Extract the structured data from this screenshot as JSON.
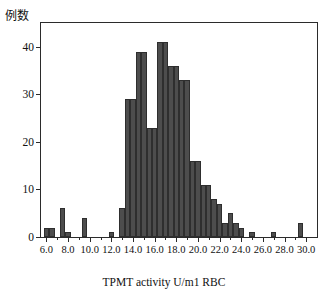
{
  "figure": {
    "y_axis_title": "例数",
    "x_axis_title": "TPMT activity U/m1 RBC",
    "bar_color": "#4d4d4d",
    "bar_edge_color": "#2e2e2e",
    "axis_color": "#2b2b2b",
    "background": "#ffffff"
  },
  "chart_data": {
    "type": "bar",
    "title": "",
    "subtitle": "",
    "xlabel": "TPMT activity U/m1 RBC",
    "ylabel": "例数",
    "xlim": [
      5.5,
      31.0
    ],
    "ylim": [
      0,
      45
    ],
    "grid": false,
    "legend": null,
    "bin_width": 0.5,
    "x_tick_labels": [
      "6.0",
      "8.0",
      "10.0",
      "12.0",
      "14.0",
      "16.0",
      "18.0",
      "20.0",
      "22.0",
      "24.0",
      "26.0",
      "28.0",
      "30.0"
    ],
    "x_tick_values": [
      6.0,
      8.0,
      10.0,
      12.0,
      14.0,
      16.0,
      18.0,
      20.0,
      22.0,
      24.0,
      26.0,
      28.0,
      30.0
    ],
    "y_tick_labels": [
      "0",
      "10",
      "20",
      "30",
      "40"
    ],
    "y_tick_values": [
      0,
      10,
      20,
      30,
      40
    ],
    "bins": [
      {
        "x0": 5.75,
        "x1": 6.25,
        "value": 2
      },
      {
        "x0": 6.25,
        "x1": 6.75,
        "value": 2
      },
      {
        "x0": 6.75,
        "x1": 7.25,
        "value": 0
      },
      {
        "x0": 7.25,
        "x1": 7.75,
        "value": 6
      },
      {
        "x0": 7.75,
        "x1": 8.25,
        "value": 1
      },
      {
        "x0": 8.25,
        "x1": 8.75,
        "value": 0
      },
      {
        "x0": 8.75,
        "x1": 9.25,
        "value": 0
      },
      {
        "x0": 9.25,
        "x1": 9.75,
        "value": 4
      },
      {
        "x0": 9.75,
        "x1": 10.25,
        "value": 0
      },
      {
        "x0": 10.25,
        "x1": 10.75,
        "value": 0
      },
      {
        "x0": 10.75,
        "x1": 11.25,
        "value": 0
      },
      {
        "x0": 11.25,
        "x1": 11.75,
        "value": 0
      },
      {
        "x0": 11.75,
        "x1": 12.25,
        "value": 1
      },
      {
        "x0": 12.25,
        "x1": 12.75,
        "value": 0
      },
      {
        "x0": 12.75,
        "x1": 13.25,
        "value": 6
      },
      {
        "x0": 13.25,
        "x1": 13.75,
        "value": 29
      },
      {
        "x0": 13.75,
        "x1": 14.25,
        "value": 29
      },
      {
        "x0": 14.25,
        "x1": 14.75,
        "value": 39
      },
      {
        "x0": 14.75,
        "x1": 15.25,
        "value": 39
      },
      {
        "x0": 15.25,
        "x1": 15.75,
        "value": 23
      },
      {
        "x0": 15.75,
        "x1": 16.25,
        "value": 23
      },
      {
        "x0": 16.25,
        "x1": 16.75,
        "value": 41
      },
      {
        "x0": 16.75,
        "x1": 17.25,
        "value": 41
      },
      {
        "x0": 17.25,
        "x1": 17.75,
        "value": 36
      },
      {
        "x0": 17.75,
        "x1": 18.25,
        "value": 36
      },
      {
        "x0": 18.25,
        "x1": 18.75,
        "value": 33
      },
      {
        "x0": 18.75,
        "x1": 19.25,
        "value": 33
      },
      {
        "x0": 19.25,
        "x1": 19.75,
        "value": 16
      },
      {
        "x0": 19.75,
        "x1": 20.25,
        "value": 16
      },
      {
        "x0": 20.25,
        "x1": 20.75,
        "value": 11
      },
      {
        "x0": 20.75,
        "x1": 21.25,
        "value": 11
      },
      {
        "x0": 21.25,
        "x1": 21.75,
        "value": 8
      },
      {
        "x0": 21.75,
        "x1": 22.25,
        "value": 7
      },
      {
        "x0": 22.25,
        "x1": 22.75,
        "value": 3
      },
      {
        "x0": 22.75,
        "x1": 23.25,
        "value": 5
      },
      {
        "x0": 23.25,
        "x1": 23.75,
        "value": 3
      },
      {
        "x0": 23.75,
        "x1": 24.25,
        "value": 2
      },
      {
        "x0": 24.25,
        "x1": 24.75,
        "value": 0
      },
      {
        "x0": 24.75,
        "x1": 25.25,
        "value": 1
      },
      {
        "x0": 25.25,
        "x1": 25.75,
        "value": 0
      },
      {
        "x0": 25.75,
        "x1": 26.25,
        "value": 0
      },
      {
        "x0": 26.25,
        "x1": 26.75,
        "value": 0
      },
      {
        "x0": 26.75,
        "x1": 27.25,
        "value": 1
      },
      {
        "x0": 27.25,
        "x1": 27.75,
        "value": 0
      },
      {
        "x0": 27.75,
        "x1": 28.25,
        "value": 0
      },
      {
        "x0": 28.25,
        "x1": 28.75,
        "value": 0
      },
      {
        "x0": 28.75,
        "x1": 29.25,
        "value": 0
      },
      {
        "x0": 29.25,
        "x1": 29.75,
        "value": 3
      },
      {
        "x0": 29.75,
        "x1": 30.25,
        "value": 0
      }
    ]
  }
}
